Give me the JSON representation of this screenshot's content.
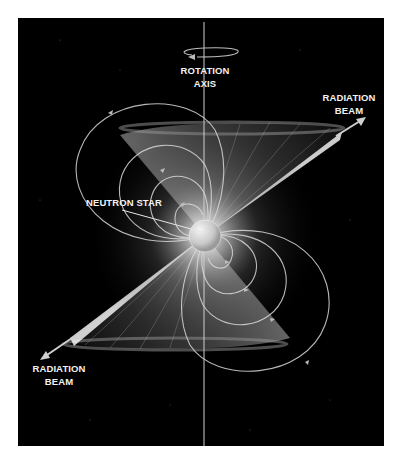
{
  "diagram": {
    "background_color": "#000000",
    "line_color": "#d8d8d8",
    "labels": {
      "rotation_axis": {
        "line1": "ROTATION",
        "line2": "AXIS"
      },
      "radiation_beam_top": {
        "line1": "RADIATION",
        "line2": "BEAM"
      },
      "radiation_beam_bottom": {
        "line1": "RADIATION",
        "line2": "BEAM"
      },
      "neutron_star": "NEUTRON STAR"
    },
    "elements": [
      "rotation-axis-line",
      "rotation-direction-arrow",
      "neutron-star",
      "magnetic-field-lines",
      "radiation-beam-cone-top",
      "radiation-beam-cone-bottom",
      "beam-arrow-top-right",
      "beam-arrow-bottom-left"
    ]
  }
}
